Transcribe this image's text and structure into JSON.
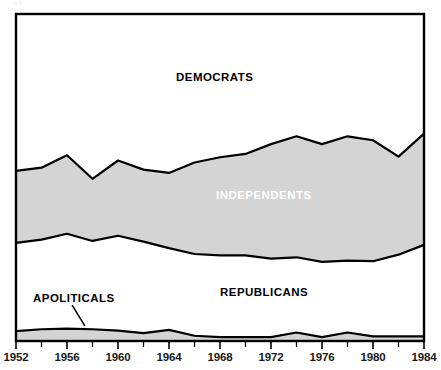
{
  "chart_data": {
    "type": "area",
    "title": "",
    "subtitle": "",
    "xlabel": "",
    "ylabel": "",
    "stacked": true,
    "grid": false,
    "legend_position": "inline-annotations",
    "xlim": [
      1952,
      1984
    ],
    "ylim": [
      0,
      100
    ],
    "x": [
      1952,
      1954,
      1956,
      1958,
      1960,
      1962,
      1964,
      1966,
      1968,
      1970,
      1972,
      1974,
      1976,
      1978,
      1980,
      1982,
      1984
    ],
    "tick_labels": [
      "1952",
      "1956",
      "1960",
      "1964",
      "1968",
      "1972",
      "1976",
      "1980",
      "1984"
    ],
    "tick_years": [
      1952,
      1956,
      1960,
      1964,
      1968,
      1972,
      1976,
      1980,
      1984
    ],
    "minor_tick_years": [
      1954,
      1958,
      1962,
      1966,
      1970,
      1974,
      1978,
      1982
    ],
    "series": [
      {
        "name": "APOLITICALS",
        "color": "#d4d4d4",
        "label_color": "#000000",
        "values": [
          3.0,
          3.6,
          3.8,
          3.6,
          3.2,
          2.4,
          3.4,
          1.6,
          1.2,
          1.2,
          1.2,
          2.6,
          1.2,
          2.6,
          1.4,
          1.4,
          1.4
        ]
      },
      {
        "name": "REPUBLICANS",
        "color": "#ffffff",
        "label_color": "#000000",
        "values": [
          27.0,
          27.4,
          29.0,
          27.0,
          29.0,
          28.0,
          25.0,
          25.0,
          25.0,
          25.0,
          24.0,
          23.0,
          23.0,
          22.0,
          23.0,
          25.0,
          28.0
        ]
      },
      {
        "name": "INDEPENDENTS",
        "color": "#d4d4d4",
        "label_color": "#ffffff",
        "values": [
          22.0,
          22.0,
          24.0,
          19.0,
          23.0,
          22.0,
          23.0,
          28.0,
          30.0,
          31.0,
          35.0,
          37.0,
          36.0,
          38.0,
          37.0,
          30.0,
          34.0
        ]
      },
      {
        "name": "DEMOCRATS",
        "color": "#ffffff",
        "label_color": "#000000",
        "values": [
          48.0,
          47.0,
          43.2,
          50.4,
          44.8,
          47.6,
          48.6,
          45.4,
          43.8,
          42.8,
          39.8,
          37.4,
          39.8,
          37.4,
          38.6,
          43.6,
          36.6
        ]
      }
    ],
    "annotations": [
      {
        "name": "apoliticals-leader-line",
        "text": "",
        "from": [
          1956.4,
          11.0
        ],
        "to": [
          1957.4,
          4.6
        ]
      }
    ]
  },
  "labels": {
    "democrats": "DEMOCRATS",
    "independents": "INDEPENDENTS",
    "republicans": "REPUBLICANS",
    "apoliticals": "APOLITICALS"
  },
  "axis": {
    "ticks": [
      "1952",
      "1956",
      "1960",
      "1964",
      "1968",
      "1972",
      "1976",
      "1980",
      "1984"
    ]
  },
  "colors": {
    "fill_gray": "#d4d4d4",
    "fill_white": "#ffffff",
    "stroke": "#000000",
    "text": "#000000",
    "inverse_text": "#ffffff"
  },
  "artifact": {
    "top_text": "ᵍ                                        ᵖ"
  }
}
